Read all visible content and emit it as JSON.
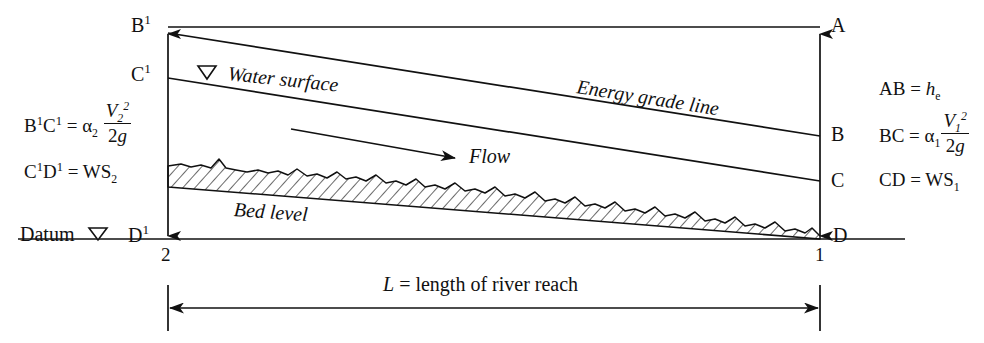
{
  "figure": {
    "background_color": "#ffffff",
    "line_color": "#111111"
  },
  "inline_labels": {
    "water_surface": "Water surface",
    "energy_grade_line": "Energy grade line",
    "flow": "Flow",
    "bed_level": "Bed level",
    "datum": "Datum"
  },
  "point_labels": {
    "b_prime": "B",
    "b_prime_sup": "1",
    "c_prime": "C",
    "c_prime_sup": "1",
    "d_prime": "D",
    "d_prime_sup": "1",
    "a": "A",
    "b": "B",
    "c": "C",
    "d": "D"
  },
  "stations": {
    "left": "2",
    "right": "1"
  },
  "equations_left": [
    {
      "lhs": "B",
      "lhs_sup": "1",
      "lhs_2": "C",
      "lhs_2_sup": "1",
      "eq": "=",
      "alpha": "α",
      "alpha_sub": "2",
      "num_var": "V",
      "num_sub": "2",
      "num_sup": "2",
      "den": "2",
      "den_var": "g"
    },
    {
      "lhs": "C",
      "lhs_sup": "1",
      "lhs_2": "D",
      "lhs_2_sup": "1",
      "eq": "=",
      "rhs": "WS",
      "rhs_sub": "2"
    }
  ],
  "equations_right": [
    {
      "lhs": "AB",
      "eq": "=",
      "rhs_var": "h",
      "rhs_sub": "e"
    },
    {
      "lhs": "BC",
      "eq": "=",
      "alpha": "α",
      "alpha_sub": "1",
      "num_var": "V",
      "num_sub": "1",
      "num_sup": "2",
      "den": "2",
      "den_var": "g"
    },
    {
      "lhs": "CD",
      "eq": "=",
      "rhs": "WS",
      "rhs_sub": "1"
    }
  ],
  "dimension": {
    "var": "L",
    "eq": "=",
    "text": "length of river reach"
  },
  "markers": {
    "water_surface_triangle": "water-level-triangle-icon",
    "datum_triangle": "datum-level-triangle-icon"
  },
  "geometry": {
    "left_station_x": 168,
    "right_station_x": 820,
    "datum_y": 239,
    "egl_left_y": 31,
    "egl_right_y": 136,
    "ws_left_y": 76,
    "ws_right_y": 181,
    "top_line_y": 31
  }
}
